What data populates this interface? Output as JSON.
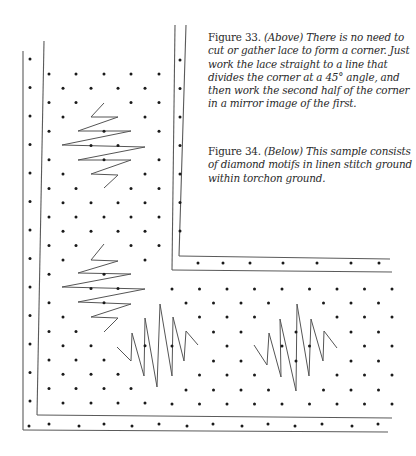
{
  "figures": [
    {
      "label": "Figure 33.",
      "text": "(Above) There is no need to cut or gather lace to form a corner. Just work the lace straight to a line that divides the corner at a 45° angle, and then work the second half of the corner in a mirror image of the first."
    },
    {
      "label": "Figure 34.",
      "text": "(Below) This sample consists of diamond motifs in linen stitch ground within torchon ground."
    }
  ],
  "diagram": {
    "line_color": "#555555",
    "dot_color": "#1a1a1a",
    "motifs": [
      {
        "name": "upper-vertical-zigzag",
        "points": [
          [
            104,
            103
          ],
          [
            91,
            117
          ],
          [
            118,
            117
          ],
          [
            78,
            131
          ],
          [
            131,
            131
          ],
          [
            62,
            145
          ],
          [
            145,
            147
          ],
          [
            78,
            160
          ],
          [
            131,
            160
          ],
          [
            91,
            174
          ],
          [
            118,
            175
          ],
          [
            104,
            188
          ]
        ]
      },
      {
        "name": "lower-vertical-zigzag",
        "points": [
          [
            104,
            244
          ],
          [
            91,
            260
          ],
          [
            118,
            261
          ],
          [
            78,
            273
          ],
          [
            131,
            274
          ],
          [
            62,
            287
          ],
          [
            145,
            289
          ],
          [
            78,
            302
          ],
          [
            131,
            304
          ],
          [
            91,
            317
          ],
          [
            118,
            318
          ],
          [
            104,
            332
          ]
        ]
      },
      {
        "name": "left-horizontal-zigzag",
        "points": [
          [
            117,
            347
          ],
          [
            131,
            361
          ],
          [
            132,
            333
          ],
          [
            144,
            376
          ],
          [
            145,
            318
          ],
          [
            157,
            387
          ],
          [
            160,
            304
          ],
          [
            172,
            376
          ],
          [
            173,
            317
          ],
          [
            184,
            361
          ],
          [
            186,
            331
          ],
          [
            198,
            345
          ]
        ]
      },
      {
        "name": "right-horizontal-zigzag",
        "points": [
          [
            254,
            345
          ],
          [
            267,
            365
          ],
          [
            269,
            333
          ],
          [
            281,
            377
          ],
          [
            280,
            319
          ],
          [
            296,
            391
          ],
          [
            297,
            304
          ],
          [
            309,
            376
          ],
          [
            311,
            319
          ],
          [
            323,
            361
          ],
          [
            324,
            331
          ],
          [
            337,
            348
          ]
        ]
      }
    ]
  }
}
